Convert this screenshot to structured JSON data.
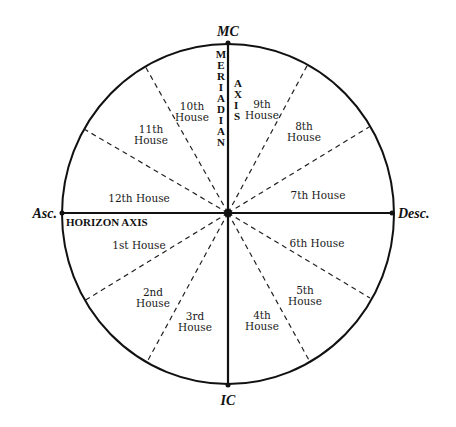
{
  "diagram": {
    "type": "astrological-house-wheel",
    "colors": {
      "line": "#111111",
      "background": "#ffffff",
      "text": "#1a1a1a"
    },
    "cardinal_points": {
      "top": "MC",
      "bottom": "IC",
      "left": "Asc.",
      "right": "Desc."
    },
    "axes": {
      "horizontal": "HORIZON AXIS",
      "vertical_letters_1": [
        "M",
        "E",
        "R",
        "I",
        "A",
        "D",
        "I",
        "A",
        "N"
      ],
      "vertical_letters_2": [
        "A",
        "X",
        "I",
        "S"
      ]
    },
    "houses": [
      {
        "id": 1,
        "line1": "1st House",
        "line2": ""
      },
      {
        "id": 2,
        "line1": "2nd",
        "line2": "House"
      },
      {
        "id": 3,
        "line1": "3rd",
        "line2": "House"
      },
      {
        "id": 4,
        "line1": "4th",
        "line2": "House"
      },
      {
        "id": 5,
        "line1": "5th",
        "line2": "House"
      },
      {
        "id": 6,
        "line1": "6th House",
        "line2": ""
      },
      {
        "id": 7,
        "line1": "7th House",
        "line2": ""
      },
      {
        "id": 8,
        "line1": "8th",
        "line2": "House"
      },
      {
        "id": 9,
        "line1": "9th",
        "line2": "House"
      },
      {
        "id": 10,
        "line1": "10th",
        "line2": "House"
      },
      {
        "id": 11,
        "line1": "11th",
        "line2": "House"
      },
      {
        "id": 12,
        "line1": "12th House",
        "line2": ""
      }
    ]
  }
}
